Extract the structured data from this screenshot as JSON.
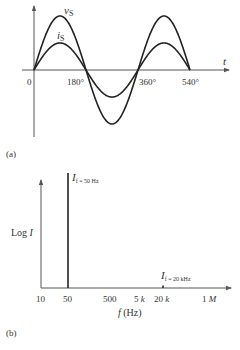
{
  "figure_a": {
    "panel_label": "(a)",
    "x_axis_label": "t",
    "tick_labels": [
      "0",
      "180°",
      "360°",
      "540°"
    ],
    "curves": [
      {
        "name": "v_S",
        "label_main": "v",
        "label_sub": "S",
        "amplitude": "large"
      },
      {
        "name": "i_S",
        "label_main": "i",
        "label_sub": "S",
        "amplitude": "small"
      }
    ]
  },
  "figure_b": {
    "panel_label": "(b)",
    "y_axis_label": "Log I",
    "x_axis_label": "f (Hz)",
    "x_ticks": [
      "10",
      "50",
      "500",
      "5 k",
      "20 k",
      "1 M"
    ],
    "spectral_lines": [
      {
        "label_main": "I",
        "label_sub": "f = 50 Hz",
        "frequency": "50 Hz",
        "magnitude": "large"
      },
      {
        "label_main": "I",
        "label_sub": "f = 20 kHz",
        "frequency": "20 kHz",
        "magnitude": "negligible"
      }
    ]
  },
  "colors": {
    "line": "#222222",
    "axis": "#555555",
    "text": "#333333"
  }
}
